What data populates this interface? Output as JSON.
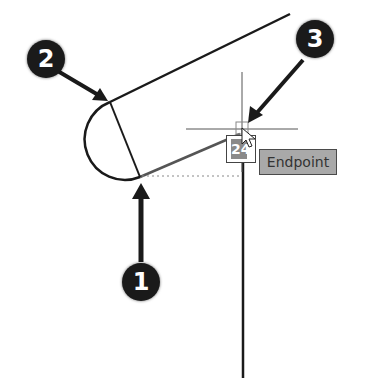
{
  "diagram": {
    "callouts": [
      {
        "number": "1",
        "target": "arc bottom endpoint"
      },
      {
        "number": "2",
        "target": "arc top endpoint"
      },
      {
        "number": "3",
        "target": "endpoint snap marker at cursor"
      }
    ],
    "snap_tooltip": "Endpoint",
    "snap_glyph_text": "24",
    "colors": {
      "line": "#1a1a1a",
      "callout_bg": "#1a1a1a",
      "tooltip_bg": "#a9a9a9",
      "tracking_line": "#888888"
    }
  }
}
